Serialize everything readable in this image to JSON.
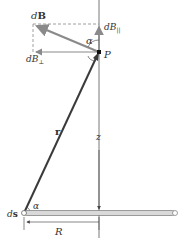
{
  "figure": {
    "labels": {
      "dB": "d",
      "dB_bold": "B",
      "dB_parallel": "dB",
      "dB_parallel_sub": "||",
      "dB_perp": "dB",
      "dB_perp_sub": "⊥",
      "alpha_top": "α",
      "alpha_bottom": "α",
      "point": "P",
      "r": "r",
      "z": "z",
      "ds": "d",
      "ds_bold": "s",
      "R": "R"
    },
    "colors": {
      "vector_gray": "#8a8a8a",
      "line_dark": "#3a3a3a",
      "axis": "#555555",
      "rod_fill": "#d9d9d9",
      "rod_edge": "#777777",
      "dashed": "#888888"
    }
  }
}
